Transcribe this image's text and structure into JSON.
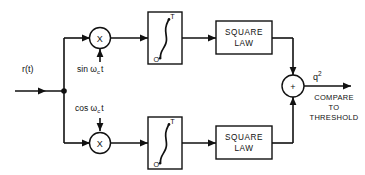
{
  "diagram": {
    "type": "block-diagram",
    "background_color": "#ffffff",
    "line_color": "#111111",
    "input": {
      "label": "r(t)",
      "name": "input-signal-label"
    },
    "branches": [
      {
        "id": "upper",
        "carrier_label": "sin ω",
        "carrier_sub": "c",
        "carrier_tail": "t",
        "multiplier_symbol": "X",
        "integrator_upper_limit": "T",
        "integrator_lower_limit": "O",
        "integrator_symbol": "∫",
        "square_law_line1": "SQUARE",
        "square_law_line2": "LAW"
      },
      {
        "id": "lower",
        "carrier_label": "cos ω",
        "carrier_sub": "c",
        "carrier_tail": "t",
        "multiplier_symbol": "X",
        "integrator_upper_limit": "T",
        "integrator_lower_limit": "O",
        "integrator_symbol": "∫",
        "square_law_line1": "SQUARE",
        "square_law_line2": "LAW"
      }
    ],
    "summer": {
      "symbol": "+",
      "name": "summing-junction"
    },
    "output": {
      "signal_label": "q",
      "signal_exponent": "2",
      "note_line1": "COMPARE",
      "note_line2": "TO",
      "note_line3": "THRESHOLD"
    }
  }
}
